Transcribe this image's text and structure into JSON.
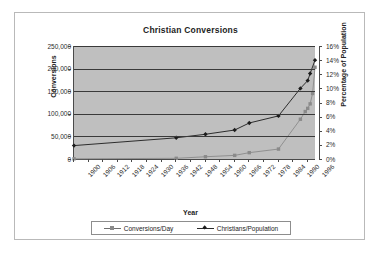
{
  "chart_title": "Christian Conversions",
  "axes": {
    "x_title": "Year",
    "y_left_title": "Conversions",
    "y_right_title": "Percentage of Population",
    "y_left_ticks": [
      "250,000",
      "200,000",
      "150,000",
      "100,000",
      "50,000",
      "0"
    ],
    "y_right_ticks": [
      "16%",
      "14%",
      "12%",
      "10%",
      "8%",
      "6%",
      "4%",
      "2%",
      "0%"
    ],
    "x_ticks": [
      "1900",
      "1906",
      "1912",
      "1918",
      "1924",
      "1930",
      "1936",
      "1942",
      "1948",
      "1954",
      "1960",
      "1966",
      "1972",
      "1978",
      "1984",
      "1990",
      "1996"
    ]
  },
  "legend": {
    "entries": [
      {
        "label": "Conversions/Day",
        "marker": "square-marker",
        "color": "#8a8a8a"
      },
      {
        "label": "Christians/Population",
        "marker": "diamond-marker",
        "color": "#1c1c1c"
      }
    ]
  },
  "colors": {
    "plot_background": "#bfbfbf",
    "gridline": "#3a3a3a",
    "axis": "#4a4a4a",
    "series_conversions": "#8a8a8a",
    "series_christians": "#1c1c1c",
    "frame": "#b9b9b9",
    "page_background": "#ffffff"
  },
  "chart_data": {
    "type": "line",
    "title": "Christian Conversions",
    "xlabel": "Year",
    "grid": "horizontal",
    "legend_position": "bottom",
    "xlim": [
      1900,
      1999
    ],
    "x_tick_interval": 6,
    "axes": [
      {
        "id": "left",
        "label": "Conversions",
        "ylim": [
          0,
          250000
        ],
        "tick_step": 50000
      },
      {
        "id": "right",
        "label": "Percentage of Population",
        "ylim": [
          0,
          16
        ],
        "tick_step": 2,
        "unit": "%"
      }
    ],
    "series": [
      {
        "name": "Conversions/Day",
        "axis": "left",
        "marker": "square",
        "color": "#8a8a8a",
        "points": [
          {
            "x": 1900,
            "y": 400
          },
          {
            "x": 1942,
            "y": 1500
          },
          {
            "x": 1954,
            "y": 5000
          },
          {
            "x": 1966,
            "y": 8000
          },
          {
            "x": 1972,
            "y": 14000
          },
          {
            "x": 1984,
            "y": 22000
          },
          {
            "x": 1993,
            "y": 88000
          },
          {
            "x": 1995,
            "y": 105000
          },
          {
            "x": 1996,
            "y": 112000
          },
          {
            "x": 1997,
            "y": 122000
          },
          {
            "x": 1998,
            "y": 145000
          },
          {
            "x": 1999,
            "y": 203000
          }
        ]
      },
      {
        "name": "Christians/Population",
        "axis": "right",
        "marker": "diamond",
        "color": "#1c1c1c",
        "points": [
          {
            "x": 1900,
            "y": 1.9
          },
          {
            "x": 1942,
            "y": 3.0
          },
          {
            "x": 1954,
            "y": 3.5
          },
          {
            "x": 1966,
            "y": 4.1
          },
          {
            "x": 1972,
            "y": 5.1
          },
          {
            "x": 1984,
            "y": 6.1
          },
          {
            "x": 1993,
            "y": 10.0
          },
          {
            "x": 1996,
            "y": 11.1
          },
          {
            "x": 1997,
            "y": 12.1
          },
          {
            "x": 1999,
            "y": 14.0
          }
        ]
      }
    ]
  }
}
